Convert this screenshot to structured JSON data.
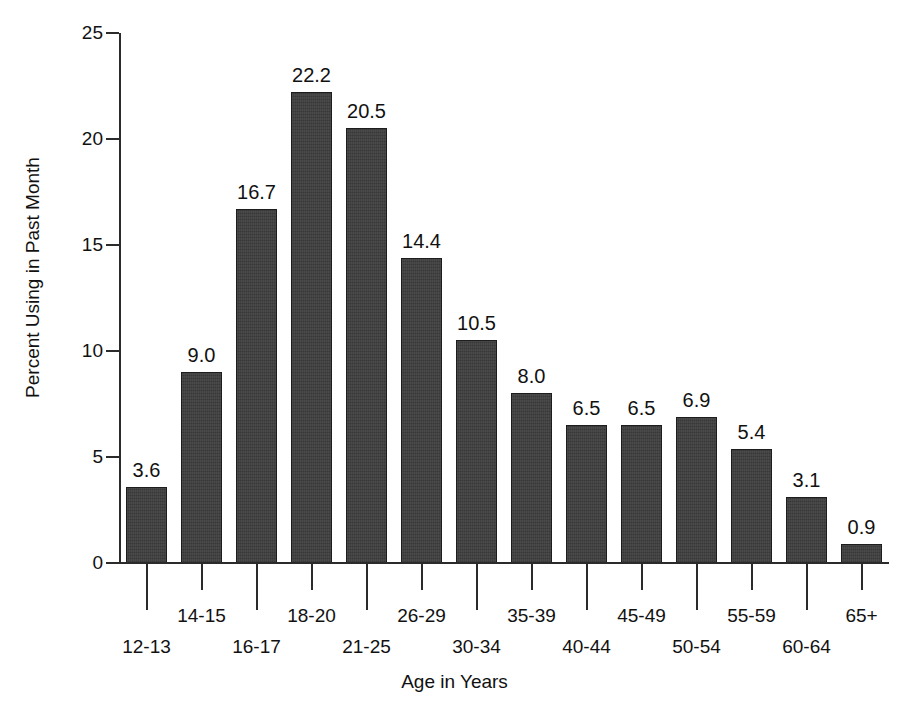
{
  "chart_data": {
    "type": "bar",
    "title": "",
    "xlabel": "Age in Years",
    "ylabel": "Percent Using in Past Month",
    "categories": [
      "12-13",
      "14-15",
      "16-17",
      "18-20",
      "21-25",
      "26-29",
      "30-34",
      "35-39",
      "40-44",
      "45-49",
      "50-54",
      "55-59",
      "60-64",
      "65+"
    ],
    "values": [
      3.6,
      9.0,
      16.7,
      22.2,
      20.5,
      14.4,
      10.5,
      8.0,
      6.5,
      6.5,
      6.9,
      5.4,
      3.1,
      0.9
    ],
    "value_labels": [
      "3.6",
      "9.0",
      "16.7",
      "22.2",
      "20.5",
      "14.4",
      "10.5",
      "8.0",
      "6.5",
      "6.5",
      "6.9",
      "5.4",
      "3.1",
      "0.9"
    ],
    "ylim": [
      0,
      25
    ],
    "ytick_values": [
      0,
      5,
      10,
      15,
      20,
      25
    ],
    "ytick_labels": [
      "0",
      "5",
      "10",
      "15",
      "20",
      "25"
    ],
    "grid": false,
    "legend": "none",
    "bar_color": "#3c3c3c",
    "bar_edge_color": "#1d1d1d",
    "axis_color": "#2b2b2b",
    "background_color": "#ffffff",
    "xlabel_rows": [
      "bottom",
      "top",
      "bottom",
      "top",
      "bottom",
      "top",
      "bottom",
      "top",
      "bottom",
      "top",
      "bottom",
      "top",
      "bottom",
      "top"
    ]
  }
}
